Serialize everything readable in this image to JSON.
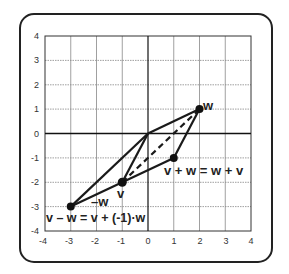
{
  "diagram": {
    "type": "vector-parallelogram",
    "xlim": [
      -4,
      4
    ],
    "ylim": [
      -4,
      4
    ],
    "x_ticks": [
      "-4",
      "-3",
      "-2",
      "-1",
      "0",
      "1",
      "2",
      "3",
      "4"
    ],
    "y_ticks": [
      "4",
      "3",
      "2",
      "1",
      "0",
      "-1",
      "-2",
      "-3",
      "-4"
    ],
    "points": {
      "w": {
        "x": 2,
        "y": 1,
        "label": "w"
      },
      "v": {
        "x": -1,
        "y": -2,
        "label": "v"
      },
      "v_plus_w": {
        "x": 1,
        "y": -1,
        "label": "v + w = w + v"
      },
      "v_minus_w": {
        "x": -3,
        "y": -3,
        "label": "v – w = v + (-1)·w"
      }
    },
    "neg_w_label": "–w",
    "colors": {
      "line": "#1a1a1a",
      "grid": "#888888",
      "frame": "#222222"
    }
  }
}
